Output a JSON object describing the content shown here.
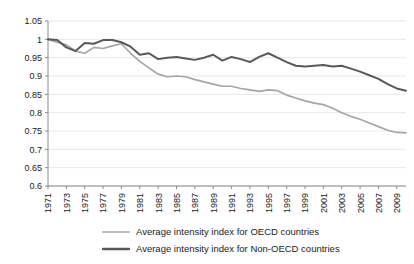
{
  "chart_data": {
    "type": "line",
    "title": "",
    "subtitle": "",
    "xlabel": "",
    "ylabel": "",
    "xlim": [
      1971,
      2010
    ],
    "ylim": [
      0.6,
      1.05
    ],
    "ytick_step": 0.05,
    "grid": true,
    "legend_position": "bottom",
    "ytick_labels": [
      "0.6",
      "0.65",
      "0.7",
      "0.75",
      "0.8",
      "0.85",
      "0.9",
      "0.95",
      "1",
      "1.05"
    ],
    "ytick_values": [
      0.6,
      0.65,
      0.7,
      0.75,
      0.8,
      0.85,
      0.9,
      0.95,
      1.0,
      1.05
    ],
    "xtick_labels": [
      "1971",
      "1973",
      "1975",
      "1977",
      "1979",
      "1981",
      "1983",
      "1985",
      "1987",
      "1989",
      "1991",
      "1993",
      "1995",
      "1997",
      "1999",
      "2001",
      "2003",
      "2005",
      "2007",
      "2009"
    ],
    "xtick_values": [
      1971,
      1973,
      1975,
      1977,
      1979,
      1981,
      1983,
      1985,
      1987,
      1989,
      1991,
      1993,
      1995,
      1997,
      1999,
      2001,
      2003,
      2005,
      2007,
      2009
    ],
    "x": [
      1971,
      1972,
      1973,
      1974,
      1975,
      1976,
      1977,
      1978,
      1979,
      1980,
      1981,
      1982,
      1983,
      1984,
      1985,
      1986,
      1987,
      1988,
      1989,
      1990,
      1991,
      1992,
      1993,
      1994,
      1995,
      1996,
      1997,
      1998,
      1999,
      2000,
      2001,
      2002,
      2003,
      2004,
      2005,
      2006,
      2007,
      2008,
      2009,
      2010
    ],
    "series": [
      {
        "name": "Average intensity index for OECD countries",
        "color": "#a6a6a6",
        "width": 1.7,
        "values": [
          1.0,
          0.992,
          0.985,
          0.968,
          0.962,
          0.978,
          0.975,
          0.982,
          0.988,
          0.962,
          0.94,
          0.922,
          0.905,
          0.898,
          0.9,
          0.898,
          0.89,
          0.884,
          0.878,
          0.872,
          0.872,
          0.866,
          0.862,
          0.858,
          0.862,
          0.86,
          0.848,
          0.84,
          0.832,
          0.826,
          0.822,
          0.812,
          0.8,
          0.79,
          0.782,
          0.772,
          0.762,
          0.752,
          0.746,
          0.745
        ]
      },
      {
        "name": "Average intensity index for Non-OECD countries",
        "color": "#595959",
        "width": 2.0,
        "values": [
          1.0,
          0.998,
          0.978,
          0.968,
          0.99,
          0.988,
          0.998,
          0.998,
          0.992,
          0.98,
          0.958,
          0.962,
          0.946,
          0.95,
          0.952,
          0.948,
          0.944,
          0.95,
          0.958,
          0.942,
          0.952,
          0.946,
          0.938,
          0.952,
          0.962,
          0.95,
          0.938,
          0.928,
          0.926,
          0.928,
          0.93,
          0.926,
          0.928,
          0.92,
          0.912,
          0.902,
          0.892,
          0.878,
          0.866,
          0.86
        ]
      }
    ]
  },
  "legend": {
    "items": [
      {
        "label": "Average intensity index for OECD countries",
        "color": "#a6a6a6"
      },
      {
        "label": "Average intensity index for Non-OECD countries",
        "color": "#595959"
      }
    ]
  }
}
